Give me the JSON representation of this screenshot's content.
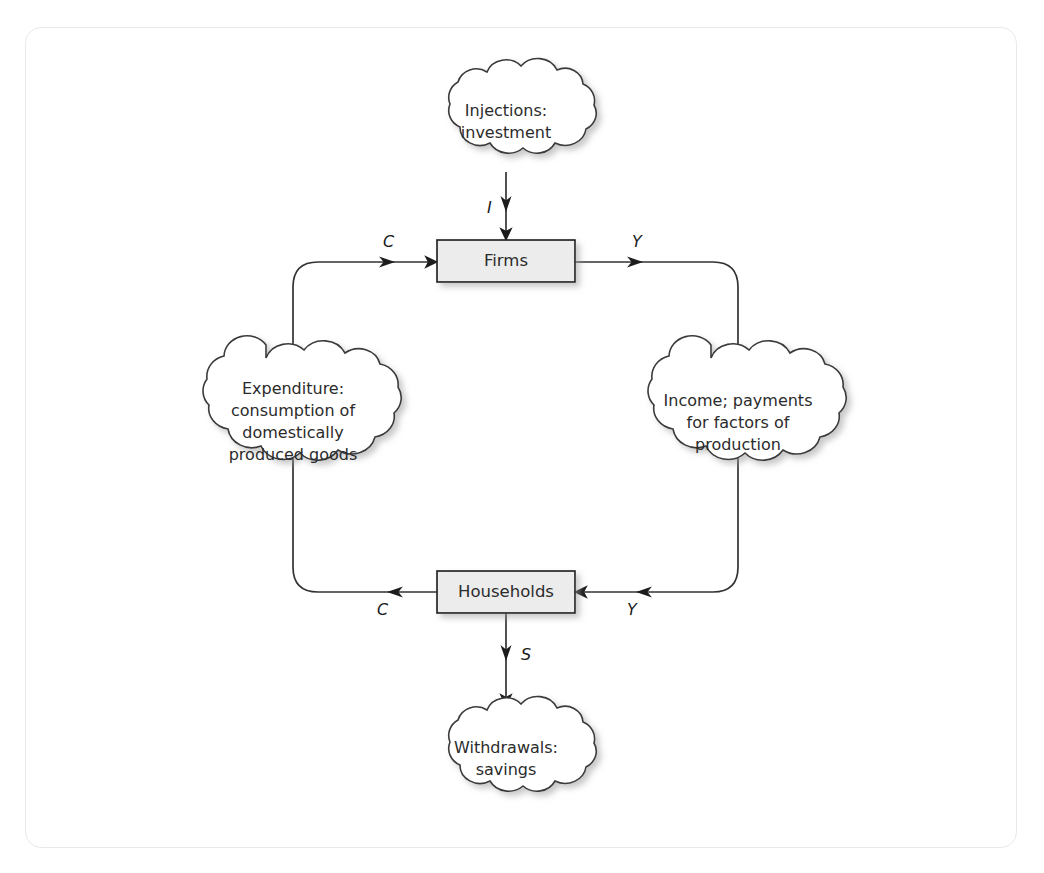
{
  "figure": {
    "type": "circular-flow-diagram",
    "background_color": "#ffffff",
    "frame_color": "#e9e9e9",
    "line_color": "#333333",
    "box_fill_color": "#ececec",
    "box_border_color": "#1a1a1a",
    "text_color": "#2b2b2b"
  },
  "nodes": {
    "injections_cloud": {
      "shape": "cloud",
      "label": "Injections:\ninvestment"
    },
    "firms_box": {
      "shape": "rectangle",
      "label": "Firms"
    },
    "expenditure_cloud": {
      "shape": "cloud",
      "label": "Expenditure:\nconsumption of\ndomestically\nproduced goods"
    },
    "income_cloud": {
      "shape": "cloud",
      "label": "Income; payments\nfor factors of\nproduction"
    },
    "households_box": {
      "shape": "rectangle",
      "label": "Households"
    },
    "withdrawals_cloud": {
      "shape": "cloud",
      "label": "Withdrawals:\nsavings"
    }
  },
  "flow_labels": {
    "injection_I": "I",
    "consumption_into_firms_C": "C",
    "income_out_of_firms_Y": "Y",
    "consumption_out_of_households_C": "C",
    "income_into_households_Y": "Y",
    "savings_S": "S"
  },
  "flows": [
    {
      "from": "injections_cloud",
      "to": "firms_box",
      "label": "I",
      "direction": "down"
    },
    {
      "from": "expenditure_cloud",
      "to": "firms_box",
      "label": "C",
      "direction": "up-right"
    },
    {
      "from": "firms_box",
      "to": "income_cloud",
      "label": "Y",
      "direction": "right-down"
    },
    {
      "from": "income_cloud",
      "to": "households_box",
      "label": "Y",
      "direction": "down-left"
    },
    {
      "from": "households_box",
      "to": "expenditure_cloud",
      "label": "C",
      "direction": "left-up"
    },
    {
      "from": "households_box",
      "to": "withdrawals_cloud",
      "label": "S",
      "direction": "down"
    }
  ]
}
